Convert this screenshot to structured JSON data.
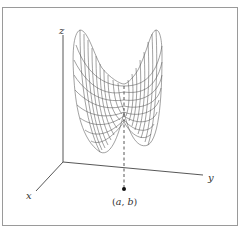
{
  "diagram": {
    "type": "3d-surface-plot",
    "axes": {
      "x_label": "x",
      "y_label": "y",
      "z_label": "z"
    },
    "point_label": {
      "open": "(",
      "a": "a",
      "sep": ", ",
      "b": "b",
      "close": ")"
    },
    "colors": {
      "line": "#444444",
      "frame": "#9a9a9a",
      "background": "#ffffff"
    }
  }
}
